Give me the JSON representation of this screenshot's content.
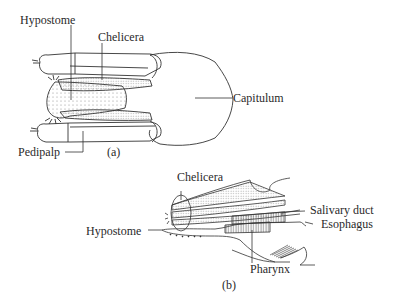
{
  "figure": {
    "panel_a": {
      "caption": "(a)",
      "labels": {
        "hypostome": "Hypostome",
        "chelicera": "Chelicera",
        "capitulum": "Capitulum",
        "pedipalp": "Pedipalp"
      }
    },
    "panel_b": {
      "caption": "(b)",
      "labels": {
        "chelicera": "Chelicera",
        "salivary_duct": "Salivary duct",
        "esophagus": "Esophagus",
        "hypostome": "Hypostome",
        "pharynx": "Pharynx"
      }
    },
    "colors": {
      "line": "#333333",
      "stipple": "#888888",
      "background": "#ffffff"
    }
  }
}
